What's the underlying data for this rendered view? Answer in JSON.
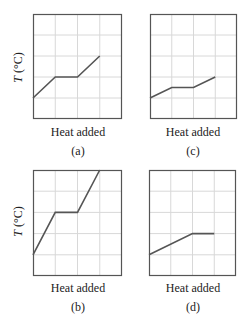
{
  "figure": {
    "panels": [
      {
        "id": "a",
        "label": "(a)",
        "xlabel": "Heat added",
        "ylabel_var": "T",
        "ylabel_unit": " (°C)"
      },
      {
        "id": "c",
        "label": "(c)",
        "xlabel": "Heat added"
      },
      {
        "id": "b",
        "label": "(b)",
        "xlabel": "Heat added",
        "ylabel_var": "T",
        "ylabel_unit": " (°C)"
      },
      {
        "id": "d",
        "label": "(d)",
        "xlabel": "Heat added"
      }
    ]
  },
  "chart_data": [
    {
      "type": "line",
      "title": "(a)",
      "xlabel": "Heat added",
      "ylabel": "T (°C)",
      "grid": true,
      "xlim": [
        0,
        4
      ],
      "ylim": [
        0,
        5
      ],
      "x": [
        0,
        1,
        2,
        3
      ],
      "values": [
        1,
        2,
        2,
        3
      ]
    },
    {
      "type": "line",
      "title": "(c)",
      "xlabel": "Heat added",
      "ylabel": "",
      "grid": true,
      "xlim": [
        0,
        4
      ],
      "ylim": [
        0,
        5
      ],
      "x": [
        0,
        1,
        2,
        3
      ],
      "values": [
        1,
        1.5,
        1.5,
        2
      ]
    },
    {
      "type": "line",
      "title": "(b)",
      "xlabel": "Heat added",
      "ylabel": "T (°C)",
      "grid": true,
      "xlim": [
        0,
        4
      ],
      "ylim": [
        0,
        5
      ],
      "x": [
        0,
        1,
        2,
        3
      ],
      "values": [
        1,
        3,
        3,
        5
      ]
    },
    {
      "type": "line",
      "title": "(d)",
      "xlabel": "Heat added",
      "ylabel": "",
      "grid": true,
      "xlim": [
        0,
        4
      ],
      "ylim": [
        0,
        5
      ],
      "x": [
        0,
        2,
        3
      ],
      "values": [
        1,
        2,
        2
      ]
    }
  ],
  "style": {
    "line_color": "#555555",
    "grid_color": "#d8d8d8",
    "frame_color": "#555555"
  }
}
